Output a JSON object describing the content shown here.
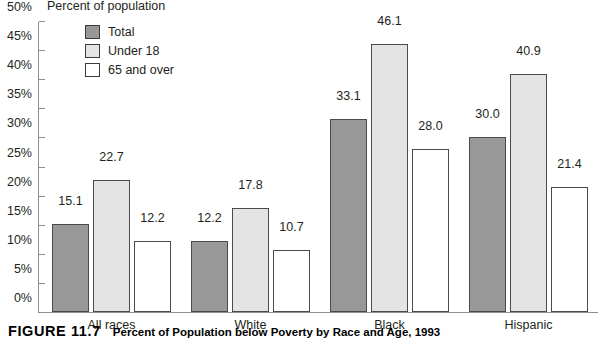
{
  "chart_data": {
    "type": "bar",
    "title": "Percent of Population below Poverty by Race and Age, 1993",
    "ylabel": "Percent of population",
    "xlabel": "",
    "ylim": [
      0,
      50
    ],
    "ytick_labels": [
      "0%",
      "5%",
      "10%",
      "15%",
      "20%",
      "25%",
      "30%",
      "35%",
      "40%",
      "45%",
      "50%"
    ],
    "ytick_values": [
      0,
      5,
      10,
      15,
      20,
      25,
      30,
      35,
      40,
      45,
      50
    ],
    "grid": false,
    "legend_position": "top-left",
    "categories": [
      "All races",
      "White",
      "Black",
      "Hispanic"
    ],
    "series": [
      {
        "name": "Total",
        "values": [
          15.1,
          12.2,
          33.1,
          30.0
        ],
        "color": "#989898"
      },
      {
        "name": "Under 18",
        "values": [
          22.7,
          17.8,
          46.1,
          40.9
        ],
        "color": "#e4e4e4"
      },
      {
        "name": "65 and over",
        "values": [
          12.2,
          10.7,
          28.0,
          21.4
        ],
        "color": "#ffffff"
      }
    ],
    "value_labels": [
      [
        "15.1",
        "22.7",
        "12.2"
      ],
      [
        "12.2",
        "17.8",
        "10.7"
      ],
      [
        "33.1",
        "46.1",
        "28.0"
      ],
      [
        "30.0",
        "40.9",
        "21.4"
      ]
    ]
  },
  "caption": {
    "figure_number": "FIGURE 11.7",
    "figure_text": "Percent of Population below Poverty by Race and Age, 1993"
  }
}
